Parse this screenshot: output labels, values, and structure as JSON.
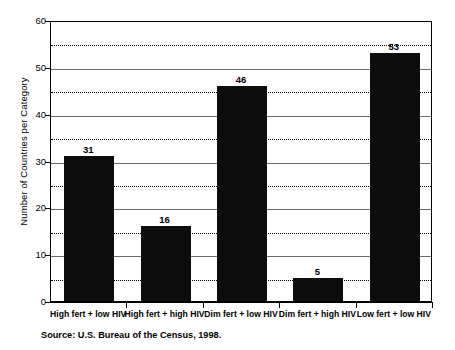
{
  "chart_data": {
    "type": "bar",
    "title": "",
    "xlabel": "",
    "ylabel": "Number of Countries per Category",
    "ylim": [
      0,
      60
    ],
    "ytick_values": [
      0,
      10,
      20,
      30,
      40,
      50,
      60
    ],
    "ytick_labels": [
      "0",
      "10",
      "20",
      "30",
      "40",
      "50",
      "60"
    ],
    "minor_gridline_values": [
      5,
      15,
      25,
      35,
      45,
      55
    ],
    "grid": true,
    "legend": "none",
    "bar_color": "#0d0d0d",
    "categories": [
      "High fert + low HIV",
      "High fert + high HIV",
      "Dim fert + low HIV",
      "Dim fert + high HIV",
      "Low fert + low HIV"
    ],
    "values": [
      31,
      16,
      46,
      5,
      53
    ],
    "value_labels": [
      "31",
      "16",
      "46",
      "5",
      "53"
    ],
    "annotations": []
  },
  "source_note": "Source: U.S. Bureau of the Census, 1998."
}
